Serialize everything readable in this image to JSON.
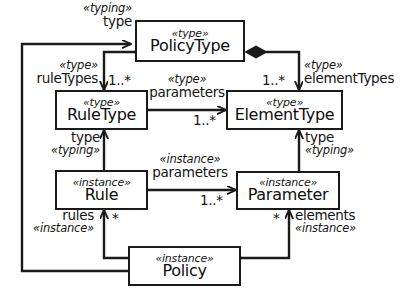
{
  "diagram": {
    "stroke_color": "#1a1a1a",
    "fill_color": "#ffffff",
    "nodes": [
      {
        "id": "policyType",
        "stereotype": "«type»",
        "name": "PolicyType"
      },
      {
        "id": "ruleType",
        "stereotype": "«type»",
        "name": "RuleType"
      },
      {
        "id": "elementType",
        "stereotype": "«type»",
        "name": "ElementType"
      },
      {
        "id": "rule",
        "stereotype": "«instance»",
        "name": "Rule"
      },
      {
        "id": "parameter",
        "stereotype": "«instance»",
        "name": "Parameter"
      },
      {
        "id": "policy",
        "stereotype": "«instance»",
        "name": "Policy"
      }
    ],
    "labels": {
      "policy_typing": {
        "stereotype": "«typing»",
        "role": "type"
      },
      "rule_types": {
        "stereotype": "«type»",
        "role": "ruleTypes",
        "multiplicity": "1..*"
      },
      "element_types": {
        "stereotype": "«type»",
        "role": "elementTypes",
        "multiplicity": "1..*"
      },
      "type_parameters": {
        "stereotype": "«type»",
        "role": "parameters",
        "multiplicity": "1..*"
      },
      "rule_typing": {
        "stereotype": "«typing»",
        "role": "type"
      },
      "parameter_typing": {
        "stereotype": "«typing»",
        "role": "type"
      },
      "instance_parameters": {
        "stereotype": "«instance»",
        "role": "parameters",
        "multiplicity": "1..*"
      },
      "rules": {
        "stereotype": "«instance»",
        "role": "rules",
        "multiplicity": "*"
      },
      "elements": {
        "stereotype": "«instance»",
        "role": "elements",
        "multiplicity": "*"
      }
    }
  }
}
